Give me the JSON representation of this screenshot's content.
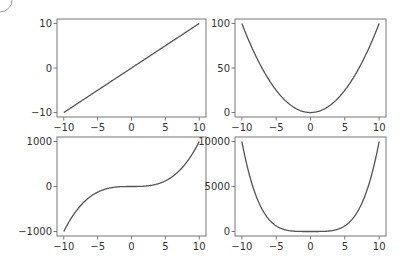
{
  "figure": {
    "width": 407,
    "height": 266,
    "background": "#ffffff",
    "line_color": "#555555",
    "spine_color": "#777777",
    "text_color": "#333333"
  },
  "chart_data": [
    {
      "type": "line",
      "title": "",
      "function": "y = x",
      "xlabel": "",
      "ylabel": "",
      "xlim": [
        -11,
        11
      ],
      "ylim": [
        -11,
        11
      ],
      "xticks": [
        -10,
        -5,
        0,
        5,
        10
      ],
      "xtick_labels": [
        "−10",
        "−5",
        "0",
        "5",
        "10"
      ],
      "yticks": [
        -10,
        0,
        10
      ],
      "ytick_labels": [
        "−10",
        "0",
        "10"
      ],
      "x": [
        -10,
        -5,
        0,
        5,
        10
      ],
      "y": [
        -10,
        -5,
        0,
        5,
        10
      ],
      "grid": false,
      "box": [
        57,
        19,
        206,
        117
      ]
    },
    {
      "type": "line",
      "title": "",
      "function": "y = x^2",
      "xlabel": "",
      "ylabel": "",
      "xlim": [
        -11,
        11
      ],
      "ylim": [
        -5,
        105
      ],
      "xticks": [
        -10,
        -5,
        0,
        5,
        10
      ],
      "xtick_labels": [
        "−10",
        "−5",
        "0",
        "5",
        "10"
      ],
      "yticks": [
        0,
        50,
        100
      ],
      "ytick_labels": [
        "0",
        "50",
        "100"
      ],
      "x": [
        -10,
        -5,
        0,
        5,
        10
      ],
      "y": [
        100,
        25,
        0,
        25,
        100
      ],
      "grid": false,
      "box": [
        235,
        19,
        386,
        117
      ]
    },
    {
      "type": "line",
      "title": "",
      "function": "y = x^3",
      "xlabel": "",
      "ylabel": "",
      "xlim": [
        -11,
        11
      ],
      "ylim": [
        -1100,
        1100
      ],
      "xticks": [
        -10,
        -5,
        0,
        5,
        10
      ],
      "xtick_labels": [
        "−10",
        "−5",
        "0",
        "5",
        "10"
      ],
      "yticks": [
        -1000,
        0,
        1000
      ],
      "ytick_labels": [
        "−1000",
        "0",
        "1000"
      ],
      "x": [
        -10,
        -5,
        0,
        5,
        10
      ],
      "y": [
        -1000,
        -125,
        0,
        125,
        1000
      ],
      "grid": false,
      "box": [
        57,
        137,
        206,
        236
      ]
    },
    {
      "type": "line",
      "title": "",
      "function": "y = x^4",
      "xlabel": "",
      "ylabel": "",
      "xlim": [
        -11,
        11
      ],
      "ylim": [
        -500,
        10500
      ],
      "xticks": [
        -10,
        -5,
        0,
        5,
        10
      ],
      "xtick_labels": [
        "−10",
        "−5",
        "0",
        "5",
        "10"
      ],
      "yticks": [
        0,
        5000,
        10000
      ],
      "ytick_labels": [
        "0",
        "5000",
        "10000"
      ],
      "x": [
        -10,
        -5,
        0,
        5,
        10
      ],
      "y": [
        10000,
        625,
        0,
        625,
        10000
      ],
      "grid": false,
      "box": [
        235,
        137,
        386,
        236
      ]
    }
  ]
}
